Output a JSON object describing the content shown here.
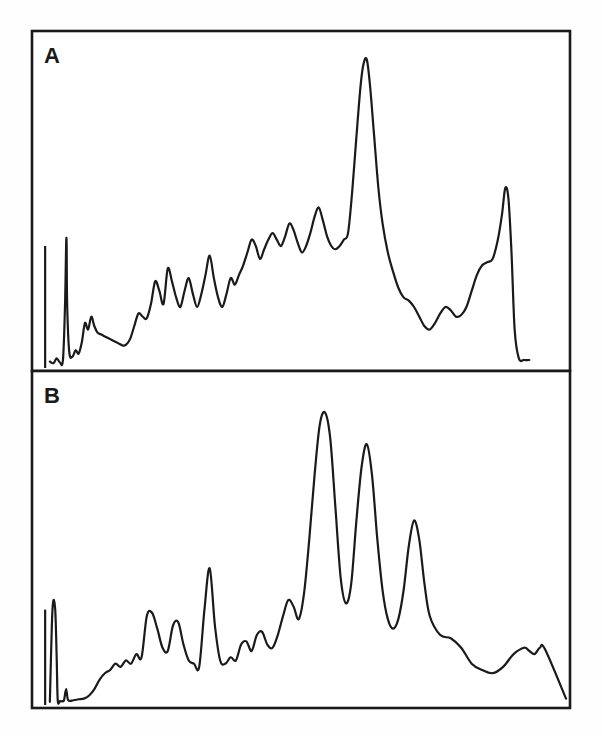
{
  "figure": {
    "title": "",
    "background_color": "#fefefe",
    "ink_color": "#1a1a1a",
    "width": 602,
    "height": 736
  },
  "panels": [
    {
      "id": "A",
      "label": "A",
      "label_x": 44,
      "label_y": 63,
      "frame": {
        "x": 32,
        "y": 31,
        "width": 538,
        "height": 340
      }
    },
    {
      "id": "B",
      "label": "B",
      "label_x": 44,
      "label_y": 403,
      "frame": {
        "x": 32,
        "y": 371,
        "width": 538,
        "height": 337
      }
    }
  ],
  "chart_data": [
    {
      "type": "line",
      "panel": "A",
      "title": "A",
      "xlabel": "",
      "ylabel": "",
      "xlim": [
        0,
        100
      ],
      "ylim": [
        0,
        100
      ],
      "grid": false,
      "legend": "none",
      "annotations": [
        "injection spike near left edge",
        "dominant peak at x ≈ 62",
        "secondary peak at x ≈ 88"
      ],
      "series": [
        {
          "name": "trace-A",
          "x": [
            1.5,
            2.2,
            2.8,
            3.4,
            4.0,
            4.4,
            4.6,
            4.7,
            4.8,
            5.2,
            5.8,
            6.4,
            7.0,
            7.6,
            8.2,
            8.8,
            9.4,
            10.0,
            10.6,
            11.2,
            11.8,
            12.4,
            13.0,
            13.6,
            14.2,
            14.8,
            15.4,
            16.0,
            16.8,
            17.6,
            18.4,
            19.2,
            20.0,
            20.8,
            21.6,
            22.4,
            23.2,
            24.0,
            24.8,
            25.6,
            26.4,
            27.2,
            28.0,
            28.8,
            29.6,
            30.4,
            31.2,
            32.0,
            32.8,
            33.6,
            34.4,
            35.2,
            36.0,
            36.8,
            37.6,
            38.4,
            39.2,
            40.0,
            40.8,
            41.6,
            42.4,
            43.2,
            44.0,
            44.8,
            45.6,
            46.4,
            47.2,
            48.0,
            48.8,
            49.6,
            50.4,
            51.2,
            52.0,
            52.8,
            53.6,
            54.4,
            55.2,
            56.0,
            56.8,
            57.6,
            58.4,
            59.2,
            60.0,
            60.8,
            61.4,
            62.0,
            62.6,
            63.4,
            64.2,
            65.0,
            66.0,
            67.0,
            68.0,
            69.0,
            70.0,
            71.0,
            72.0,
            73.0,
            74.0,
            75.0,
            76.0,
            77.0,
            78.0,
            79.0,
            80.0,
            81.0,
            82.0,
            83.0,
            84.0,
            85.0,
            86.0,
            87.0,
            87.8,
            88.4,
            89.0,
            89.6,
            90.2,
            91.0,
            92.0,
            93.0,
            94.0,
            100.0
          ],
          "y": [
            2.0,
            1.5,
            3.0,
            1.8,
            2.5,
            20.0,
            38.0,
            38.5,
            20.0,
            5.0,
            3.5,
            5.5,
            4.5,
            8.0,
            14.0,
            12.0,
            16.0,
            13.0,
            11.0,
            10.5,
            10.0,
            9.5,
            9.0,
            8.5,
            8.0,
            7.5,
            7.0,
            7.2,
            9.0,
            13.0,
            17.0,
            16.0,
            15.5,
            20.0,
            27.0,
            24.0,
            20.0,
            31.0,
            27.0,
            22.0,
            19.0,
            24.0,
            28.0,
            23.0,
            19.0,
            23.0,
            29.0,
            35.0,
            28.0,
            22.0,
            19.0,
            23.0,
            28.0,
            26.0,
            29.0,
            32.0,
            36.0,
            40.0,
            38.0,
            34.0,
            37.0,
            40.0,
            42.0,
            40.0,
            38.0,
            41.0,
            45.0,
            43.0,
            39.0,
            36.0,
            38.0,
            42.0,
            47.0,
            50.0,
            46.0,
            41.0,
            38.0,
            37.0,
            38.0,
            40.0,
            42.0,
            55.0,
            72.0,
            88.0,
            95.0,
            96.0,
            88.0,
            72.0,
            56.0,
            45.0,
            36.0,
            30.0,
            25.0,
            22.0,
            21.0,
            19.0,
            16.0,
            13.0,
            12.0,
            14.0,
            17.0,
            19.0,
            18.0,
            16.0,
            16.5,
            19.0,
            24.0,
            29.0,
            32.0,
            33.0,
            34.0,
            40.0,
            48.0,
            56.0,
            53.0,
            36.0,
            12.0,
            3.0,
            2.5,
            2.5,
            2.5
          ]
        }
      ]
    },
    {
      "type": "line",
      "panel": "B",
      "title": "B",
      "xlabel": "",
      "ylabel": "",
      "xlim": [
        0,
        100
      ],
      "ylim": [
        0,
        100
      ],
      "grid": false,
      "legend": "none",
      "annotations": [
        "injection spike near left edge",
        "tallest peak at x ≈ 48",
        "second peak at x ≈ 55",
        "third peak at x ≈ 64"
      ],
      "series": [
        {
          "name": "trace-B",
          "x": [
            1.5,
            2.0,
            2.5,
            2.8,
            3.0,
            3.4,
            3.8,
            4.2,
            4.6,
            5.0,
            6.0,
            7.0,
            8.0,
            9.0,
            10.0,
            11.0,
            12.0,
            13.0,
            14.0,
            15.0,
            16.0,
            17.0,
            18.0,
            19.0,
            20.0,
            21.0,
            22.0,
            23.0,
            24.0,
            25.0,
            26.0,
            27.0,
            28.0,
            29.0,
            30.0,
            31.0,
            32.0,
            33.0,
            34.0,
            35.0,
            36.0,
            37.0,
            38.0,
            39.0,
            40.0,
            41.0,
            42.0,
            43.0,
            44.0,
            45.0,
            46.0,
            47.0,
            48.0,
            49.0,
            50.0,
            51.0,
            52.0,
            53.0,
            54.0,
            55.0,
            56.0,
            57.0,
            58.0,
            59.0,
            60.0,
            61.0,
            62.0,
            63.0,
            64.0,
            65.0,
            66.0,
            67.0,
            68.0,
            69.0,
            70.0,
            71.0,
            72.0,
            73.0,
            74.0,
            76.0,
            78.0,
            80.0,
            82.0,
            84.0,
            86.0,
            88.0,
            90.0,
            92.0,
            93.0,
            94.0,
            95.0,
            96.0,
            100.0
          ],
          "y": [
            1.0,
            30.0,
            30.5,
            15.0,
            1.5,
            1.2,
            1.2,
            1.5,
            5.0,
            1.5,
            1.5,
            1.8,
            2.0,
            3.0,
            5.0,
            8.0,
            10.0,
            11.0,
            13.0,
            12.0,
            14.0,
            13.0,
            16.0,
            15.0,
            28.0,
            29.0,
            24.0,
            18.0,
            17.0,
            25.0,
            26.0,
            19.0,
            14.0,
            13.0,
            12.0,
            30.0,
            43.0,
            25.0,
            14.0,
            13.0,
            15.0,
            14.0,
            19.0,
            20.0,
            17.0,
            22.0,
            23.0,
            19.0,
            18.0,
            22.0,
            28.0,
            33.0,
            31.0,
            27.0,
            35.0,
            52.0,
            72.0,
            88.0,
            92.0,
            84.0,
            62.0,
            40.0,
            32.0,
            38.0,
            58.0,
            75.0,
            82.0,
            72.0,
            52.0,
            36.0,
            27.0,
            24.0,
            27.0,
            36.0,
            50.0,
            58.0,
            52.0,
            38.0,
            28.0,
            22.0,
            21.0,
            18.0,
            13.0,
            11.0,
            10.0,
            12.0,
            16.0,
            18.0,
            17.0,
            16.0,
            18.0,
            17.5,
            2.0
          ]
        }
      ]
    }
  ]
}
